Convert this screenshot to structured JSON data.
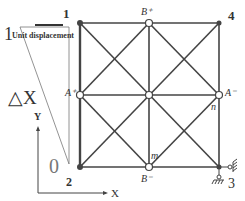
{
  "diagram": {
    "node_labels": {
      "n1": "1",
      "n2": "2",
      "n3": "3",
      "n4": "4",
      "a_plus": "A⁺",
      "a_minus": "A⁻",
      "b_plus": "B⁺",
      "b_minus": "B⁻",
      "m": "m",
      "n": "n"
    },
    "annotations": {
      "unit_value": "1",
      "unit_displacement": "Unit displacement",
      "delta_x": "△X",
      "zero": "0"
    },
    "axes": {
      "x_label": "X",
      "y_label": "Y"
    },
    "colors": {
      "line": "#444444",
      "thin_line": "#666666",
      "node_fill": "#ffffff"
    }
  }
}
